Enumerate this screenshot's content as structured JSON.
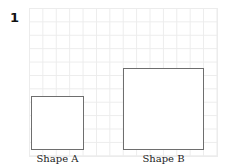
{
  "question": {
    "number": "1"
  },
  "grid": {
    "columns": 14,
    "rows": 11
  },
  "shapes": [
    {
      "label": "Shape A",
      "width_units": 4,
      "height_units": 4
    },
    {
      "label": "Shape B",
      "width_units": 6,
      "height_units": 6
    }
  ],
  "colors": {
    "outline": "#6e6e6e",
    "gridline": "#ececec"
  }
}
